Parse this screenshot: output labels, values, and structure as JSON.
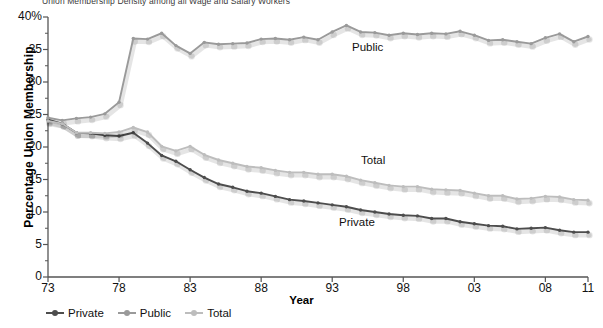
{
  "title_clipped": "Union Membership Density among all Wage and Salary Workers",
  "axes": {
    "ylabel": "Percentage Union Membership",
    "xlabel": "Year",
    "y_ticks": [
      "40%",
      "35",
      "30",
      "25",
      "20",
      "15",
      "10",
      "5",
      "0"
    ],
    "x_ticks": [
      "73",
      "78",
      "83",
      "88",
      "93",
      "98",
      "03",
      "08",
      "11"
    ]
  },
  "legend": {
    "items": [
      {
        "label": "Private",
        "color": "#4d4d4d"
      },
      {
        "label": "Public",
        "color": "#9a9a9a"
      },
      {
        "label": "Total",
        "color": "#bdbdbd"
      }
    ]
  },
  "series_labels": {
    "public": "Public",
    "total": "Total",
    "private": "Private"
  },
  "colors": {
    "private": "#4d4d4d",
    "public": "#9a9a9a",
    "total": "#bdbdbd",
    "axis": "#555555",
    "text": "#111111",
    "background": "#ffffff"
  },
  "chart_data": {
    "type": "line",
    "title": "Union Membership Density among all Wage and Salary Workers",
    "xlabel": "Year",
    "ylabel": "Percentage Union Membership",
    "xlim": [
      1973,
      2011
    ],
    "ylim": [
      0,
      40
    ],
    "ytick_values": [
      0,
      5,
      10,
      15,
      20,
      25,
      30,
      35,
      40
    ],
    "xtick_values": [
      1973,
      1978,
      1983,
      1988,
      1993,
      1998,
      2003,
      2008,
      2011
    ],
    "grid": false,
    "legend_position": "below-axis-left",
    "markers": true,
    "x": [
      1973,
      1974,
      1975,
      1976,
      1977,
      1978,
      1979,
      1980,
      1981,
      1982,
      1983,
      1984,
      1985,
      1986,
      1987,
      1988,
      1989,
      1990,
      1991,
      1992,
      1993,
      1994,
      1995,
      1996,
      1997,
      1998,
      1999,
      2000,
      2001,
      2002,
      2003,
      2004,
      2005,
      2006,
      2007,
      2008,
      2009,
      2010,
      2011
    ],
    "series": [
      {
        "name": "Private",
        "color": "#4d4d4d",
        "values": [
          24.2,
          23.6,
          22.2,
          22.1,
          21.8,
          21.7,
          22.2,
          20.6,
          18.7,
          17.8,
          16.5,
          15.3,
          14.3,
          13.8,
          13.2,
          12.9,
          12.4,
          11.9,
          11.7,
          11.4,
          11.1,
          10.8,
          10.3,
          10.0,
          9.7,
          9.5,
          9.4,
          9.0,
          9.0,
          8.5,
          8.2,
          7.9,
          7.8,
          7.4,
          7.5,
          7.6,
          7.2,
          6.9,
          6.9
        ]
      },
      {
        "name": "Public",
        "color": "#9a9a9a",
        "values": [
          24.5,
          24.1,
          24.4,
          24.6,
          25.1,
          26.9,
          36.7,
          36.6,
          37.5,
          35.6,
          34.4,
          36.1,
          35.8,
          35.9,
          36.0,
          36.6,
          36.7,
          36.5,
          36.9,
          36.5,
          37.7,
          38.7,
          37.7,
          37.6,
          37.2,
          37.5,
          37.3,
          37.5,
          37.4,
          37.8,
          37.2,
          36.4,
          36.5,
          36.2,
          35.9,
          36.8,
          37.4,
          36.2,
          37.0
        ]
      },
      {
        "name": "Total",
        "color": "#bdbdbd",
        "values": [
          24.0,
          23.6,
          22.2,
          22.2,
          22.1,
          22.3,
          23.0,
          22.3,
          20.1,
          19.4,
          20.1,
          18.8,
          18.0,
          17.5,
          17.0,
          16.8,
          16.4,
          16.1,
          16.1,
          15.8,
          15.8,
          15.5,
          14.9,
          14.5,
          14.1,
          13.9,
          13.9,
          13.5,
          13.4,
          13.3,
          12.9,
          12.5,
          12.5,
          12.0,
          12.1,
          12.4,
          12.3,
          11.9,
          11.8
        ]
      }
    ]
  }
}
